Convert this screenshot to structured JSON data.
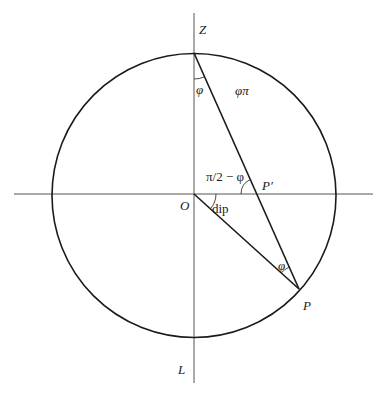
{
  "diagram": {
    "type": "stereographic-projection-geometry",
    "labels": {
      "zenith": "Z",
      "lower": "L",
      "origin": "O",
      "point": "P",
      "projected_point": "P′",
      "angle_at_top": "φ",
      "arc_label": "φπ",
      "angle_at_pprime": "π/2 − φ",
      "dip": "dip",
      "angle_at_p": "φ"
    },
    "geometry": {
      "center": [
        194,
        195
      ],
      "radius": 142,
      "vertical_axis": {
        "x": 194,
        "y1": 13,
        "y2": 383
      },
      "horizontal_axis": {
        "y": 194,
        "x1": 14,
        "x2": 373
      },
      "top_point": [
        194,
        53
      ],
      "p_point": [
        299,
        289
      ],
      "pprime_point": [
        257,
        194
      ]
    },
    "colors": {
      "circle": "#1a1a1a",
      "axes": "#555555",
      "lines": "#1a1a1a"
    }
  }
}
